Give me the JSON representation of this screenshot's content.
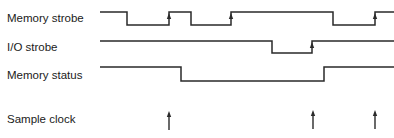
{
  "diagram": {
    "type": "timing-diagram",
    "line_color": "#2a2a2a",
    "signals": [
      {
        "name": "Memory strobe",
        "label_y": 13,
        "high_y": 12,
        "low_y": 25,
        "waveform": [
          [
            100,
            "H"
          ],
          [
            127,
            "L"
          ],
          [
            169,
            "H"
          ],
          [
            191,
            "L"
          ],
          [
            231,
            "H"
          ],
          [
            333,
            "L"
          ],
          [
            375,
            "H"
          ],
          [
            394,
            "H"
          ]
        ],
        "rising_edge_arrows": [
          169,
          231,
          375
        ]
      },
      {
        "name": "I/O strobe",
        "label_y": 42,
        "high_y": 41,
        "low_y": 53,
        "waveform": [
          [
            100,
            "H"
          ],
          [
            272,
            "L"
          ],
          [
            312,
            "H"
          ],
          [
            394,
            "H"
          ]
        ],
        "rising_edge_arrows": [
          312
        ]
      },
      {
        "name": "Memory status",
        "label_y": 70,
        "high_y": 67,
        "low_y": 81,
        "waveform": [
          [
            100,
            "H"
          ],
          [
            181,
            "L"
          ],
          [
            324,
            "H"
          ],
          [
            394,
            "H"
          ]
        ],
        "rising_edge_arrows": []
      },
      {
        "name": "Sample clock",
        "label_y": 114,
        "arrows": [
          {
            "x": 169,
            "y_top": 111,
            "y_bottom": 130
          },
          {
            "x": 313,
            "y_top": 110,
            "y_bottom": 129
          },
          {
            "x": 375,
            "y_top": 110,
            "y_bottom": 129
          }
        ]
      }
    ]
  }
}
